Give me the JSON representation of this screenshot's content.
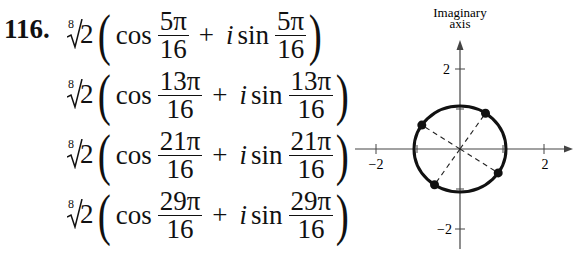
{
  "exercise": {
    "number": "116.",
    "radical": {
      "index": "8",
      "radicand": "2"
    },
    "terms": [
      {
        "cos": "cos",
        "sin": "sin",
        "i": "i",
        "plus": "+",
        "numerator": "5π",
        "denominator": "16"
      },
      {
        "cos": "cos",
        "sin": "sin",
        "i": "i",
        "plus": "+",
        "numerator": "13π",
        "denominator": "16"
      },
      {
        "cos": "cos",
        "sin": "sin",
        "i": "i",
        "plus": "+",
        "numerator": "21π",
        "denominator": "16"
      },
      {
        "cos": "cos",
        "sin": "sin",
        "i": "i",
        "plus": "+",
        "numerator": "29π",
        "denominator": "16"
      }
    ]
  },
  "graph": {
    "y_axis_label_line1": "Imaginary",
    "y_axis_label_line2": "axis",
    "x_tick_neg": "−2",
    "x_tick_pos": "2",
    "y_tick_pos": "2",
    "y_tick_neg": "−2",
    "circle_radius": 1.09,
    "points_angles": [
      "5π/16",
      "13π/16",
      "21π/16",
      "29π/16"
    ]
  }
}
